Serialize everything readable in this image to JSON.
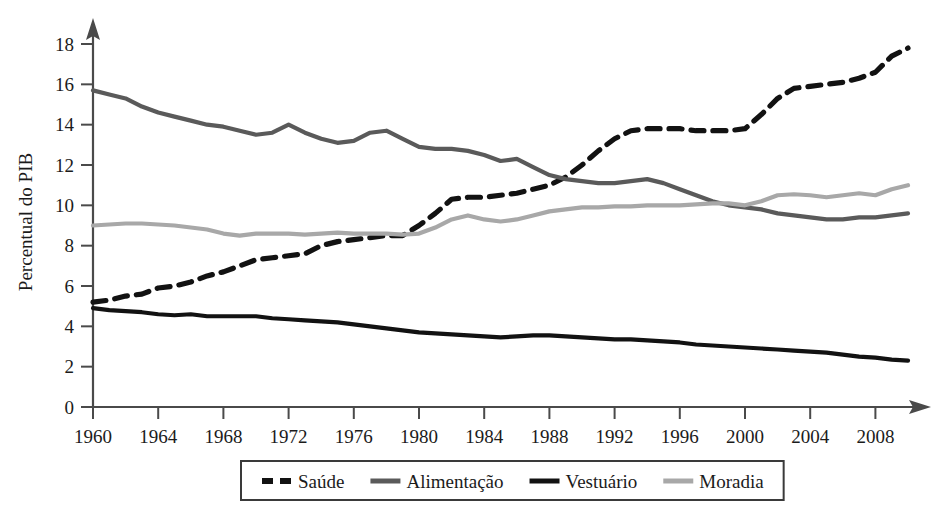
{
  "chart_data": {
    "type": "line",
    "title": "",
    "subtitle": "",
    "xlabel": "",
    "ylabel": "Percentual do PIB",
    "xlim": [
      1960,
      2010
    ],
    "ylim": [
      0,
      18
    ],
    "grid": false,
    "legend_position": "bottom",
    "y_ticks": [
      0,
      2,
      4,
      6,
      8,
      10,
      12,
      14,
      16,
      18
    ],
    "y_tick_labels": [
      "0",
      "2",
      "4",
      "6",
      "8",
      "10",
      "12",
      "14",
      "16",
      "18"
    ],
    "x_ticks": [
      1960,
      1964,
      1968,
      1972,
      1976,
      1980,
      1984,
      1988,
      1992,
      1996,
      2000,
      2004,
      2008
    ],
    "x_tick_labels": [
      "1960",
      "1964",
      "1968",
      "1972",
      "1976",
      "1980",
      "1984",
      "1988",
      "1992",
      "1996",
      "2000",
      "2004",
      "2008"
    ],
    "x": [
      1960,
      1961,
      1962,
      1963,
      1964,
      1965,
      1966,
      1967,
      1968,
      1969,
      1970,
      1971,
      1972,
      1973,
      1974,
      1975,
      1976,
      1977,
      1978,
      1979,
      1980,
      1981,
      1982,
      1983,
      1984,
      1985,
      1986,
      1987,
      1988,
      1989,
      1990,
      1991,
      1992,
      1993,
      1994,
      1995,
      1996,
      1997,
      1998,
      1999,
      2000,
      2001,
      2002,
      2003,
      2004,
      2005,
      2006,
      2007,
      2008,
      2009,
      2010
    ],
    "series": [
      {
        "name": "Saúde",
        "style": "dashed",
        "color": "#121212",
        "values": [
          5.2,
          5.3,
          5.5,
          5.6,
          5.9,
          6.0,
          6.2,
          6.5,
          6.7,
          7.0,
          7.3,
          7.4,
          7.5,
          7.6,
          8.0,
          8.2,
          8.3,
          8.4,
          8.5,
          8.5,
          9.0,
          9.6,
          10.3,
          10.4,
          10.4,
          10.5,
          10.6,
          10.8,
          11.0,
          11.4,
          12.0,
          12.7,
          13.3,
          13.7,
          13.8,
          13.8,
          13.8,
          13.7,
          13.7,
          13.7,
          13.8,
          14.5,
          15.3,
          15.8,
          15.9,
          16.0,
          16.1,
          16.3,
          16.6,
          17.4,
          17.8
        ]
      },
      {
        "name": "Alimentação",
        "style": "solid",
        "color": "#5a5a5a",
        "values": [
          15.7,
          15.5,
          15.3,
          14.9,
          14.6,
          14.4,
          14.2,
          14.0,
          13.9,
          13.7,
          13.5,
          13.6,
          14.0,
          13.6,
          13.3,
          13.1,
          13.2,
          13.6,
          13.7,
          13.3,
          12.9,
          12.8,
          12.8,
          12.7,
          12.5,
          12.2,
          12.3,
          11.9,
          11.5,
          11.3,
          11.2,
          11.1,
          11.1,
          11.2,
          11.3,
          11.1,
          10.8,
          10.5,
          10.2,
          10.0,
          9.9,
          9.8,
          9.6,
          9.5,
          9.4,
          9.3,
          9.3,
          9.4,
          9.4,
          9.5,
          9.6
        ]
      },
      {
        "name": "Vestuário",
        "style": "solid",
        "color": "#121212",
        "values": [
          4.9,
          4.8,
          4.75,
          4.7,
          4.6,
          4.55,
          4.6,
          4.5,
          4.5,
          4.5,
          4.5,
          4.4,
          4.35,
          4.3,
          4.25,
          4.2,
          4.1,
          4.0,
          3.9,
          3.8,
          3.7,
          3.65,
          3.6,
          3.55,
          3.5,
          3.45,
          3.5,
          3.55,
          3.55,
          3.5,
          3.45,
          3.4,
          3.35,
          3.35,
          3.3,
          3.25,
          3.2,
          3.1,
          3.05,
          3.0,
          2.95,
          2.9,
          2.85,
          2.8,
          2.75,
          2.7,
          2.6,
          2.5,
          2.45,
          2.35,
          2.3
        ]
      },
      {
        "name": "Moradia",
        "style": "solid",
        "color": "#a8a8a8",
        "values": [
          9.0,
          9.05,
          9.1,
          9.1,
          9.05,
          9.0,
          8.9,
          8.8,
          8.6,
          8.5,
          8.6,
          8.6,
          8.6,
          8.55,
          8.6,
          8.65,
          8.6,
          8.6,
          8.6,
          8.55,
          8.6,
          8.9,
          9.3,
          9.5,
          9.3,
          9.2,
          9.3,
          9.5,
          9.7,
          9.8,
          9.9,
          9.9,
          9.95,
          9.95,
          10.0,
          10.0,
          10.0,
          10.05,
          10.1,
          10.1,
          10.0,
          10.2,
          10.5,
          10.55,
          10.5,
          10.4,
          10.5,
          10.6,
          10.5,
          10.8,
          11.0
        ]
      }
    ],
    "legend_entries": [
      {
        "label": "Saúde",
        "style": "dashed",
        "color": "#121212"
      },
      {
        "label": "Alimentação",
        "style": "solid",
        "color": "#5a5a5a"
      },
      {
        "label": "Vestuário",
        "style": "solid",
        "color": "#121212"
      },
      {
        "label": "Moradia",
        "style": "solid",
        "color": "#a8a8a8"
      }
    ]
  },
  "axes": {
    "y_axis_title": "Percentual do PIB"
  },
  "colors": {
    "axis": "#4a4a4a",
    "text": "#1b1b1b",
    "background": "#ffffff",
    "saude": "#121212",
    "alimentacao": "#5a5a5a",
    "vestuario": "#121212",
    "moradia": "#a8a8a8"
  }
}
